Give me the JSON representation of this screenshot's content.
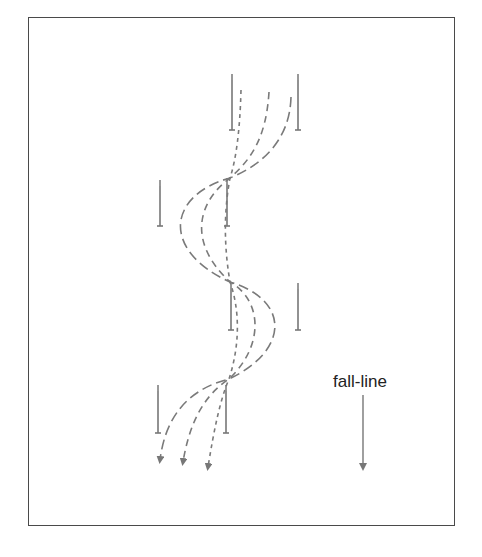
{
  "diagram": {
    "label": "fall-line",
    "colors": {
      "frame": "#4a4a4a",
      "pole": "#777777",
      "path": "#7a7a7a",
      "text": "#222222"
    },
    "poles": [
      {
        "x": 232,
        "y1": 74,
        "y2": 130
      },
      {
        "x": 298,
        "y1": 74,
        "y2": 130
      },
      {
        "x": 160,
        "y1": 181,
        "y2": 226
      },
      {
        "x": 227,
        "y1": 179,
        "y2": 226
      },
      {
        "x": 231,
        "y1": 285,
        "y2": 330
      },
      {
        "x": 298,
        "y1": 284,
        "y2": 330
      },
      {
        "x": 158,
        "y1": 386,
        "y2": 433
      },
      {
        "x": 226,
        "y1": 386,
        "y2": 433
      }
    ],
    "paths": [
      {
        "name": "short-dash-line",
        "dash": "4,4"
      },
      {
        "name": "medium-dash-line",
        "dash": "7,5"
      },
      {
        "name": "long-dash-line",
        "dash": "10,5"
      }
    ]
  }
}
